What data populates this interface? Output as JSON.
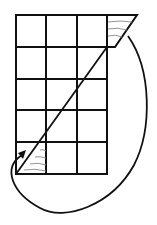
{
  "diagram": {
    "grid": {
      "columns": 3,
      "rows": 5
    },
    "colors": {
      "stroke": "#111111",
      "hatch": "#888888",
      "background": "#ffffff"
    },
    "shapes": [
      {
        "id": "top-right-triangle",
        "description": "hatched triangle outside top-right of grid"
      },
      {
        "id": "bottom-left-triangle",
        "description": "hatched triangle inside bottom-left cell"
      },
      {
        "id": "diagonal",
        "description": "diagonal cut line across grid"
      },
      {
        "id": "move-arrow",
        "description": "curved arrow from top-right triangle to bottom-left triangle"
      }
    ]
  }
}
